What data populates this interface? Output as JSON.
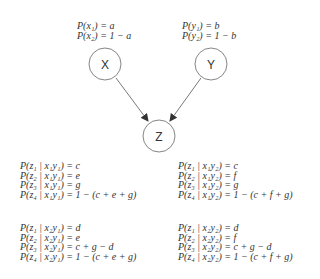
{
  "priors": {
    "x": [
      "P(x₁) = a",
      "P(x₂) = 1 − a"
    ],
    "y": [
      "P(y₁) = b",
      "P(y₂) = 1 − b"
    ]
  },
  "nodes": {
    "x": {
      "label": "X"
    },
    "y": {
      "label": "Y"
    },
    "z": {
      "label": "Z"
    }
  },
  "edges": [
    {
      "from": "X",
      "to": "Z"
    },
    {
      "from": "Y",
      "to": "Z"
    }
  ],
  "cpt": {
    "x1y1": [
      "P(z₁ | x₁y₁) = c",
      "P(z₂ | x₁y₁) = e",
      "P(z₃ | x₁y₁) = g",
      "P(z₄ | x₁y₁) = 1 − (c + e + g)"
    ],
    "x1y2": [
      "P(z₁ | x₁y₂) = c",
      "P(z₂ | x₁y₂) = f",
      "P(z₃ | x₁y₂) = g",
      "P(z₄ | x₁y₂) = 1 − (c + f + g)"
    ],
    "x2y1": [
      "P(z₁ | x₂y₁) = d",
      "P(z₂ | x₂y₁) = e",
      "P(z₃ | x₂y₁) = c + g − d",
      "P(z₄ | x₂y₁) = 1 − (c + e + g)"
    ],
    "x2y2": [
      "P(z₁ | x₂y₂) = d",
      "P(z₂ | x₂y₂) = f",
      "P(z₃ | x₂y₂) = c + g − d",
      "P(z₄ | x₂y₂) = 1 − (c + f + g)"
    ]
  }
}
